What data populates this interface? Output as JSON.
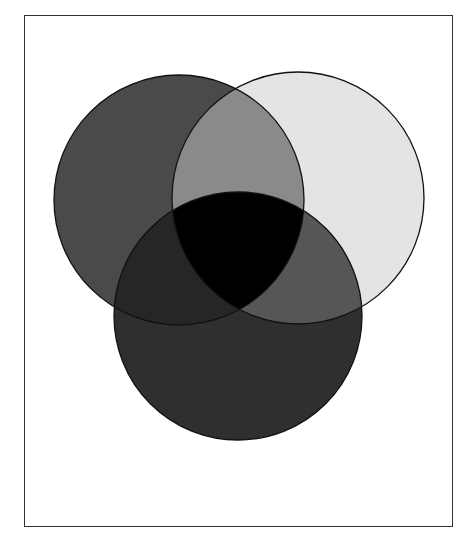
{
  "heading": {
    "text": "",
    "note": "heading clipped at top edge; only descenders visible"
  },
  "diagram": {
    "type": "venn",
    "sets": [
      {
        "id": "left",
        "name": "left-circle",
        "cx": 179,
        "cy": 200,
        "r": 125,
        "fill": "#4a4a4a"
      },
      {
        "id": "right",
        "name": "right-circle",
        "cx": 298,
        "cy": 198,
        "r": 126,
        "fill": "#e4e4e4"
      },
      {
        "id": "bottom",
        "name": "bottom-circle",
        "cx": 238,
        "cy": 316,
        "r": 124,
        "fill": "#2f2f2f"
      }
    ],
    "overlaps": {
      "left_right": "#8a8a8a",
      "left_bottom": "#262626",
      "right_bottom": "#565656",
      "all_three": "#000000"
    },
    "stroke": "#111111"
  }
}
